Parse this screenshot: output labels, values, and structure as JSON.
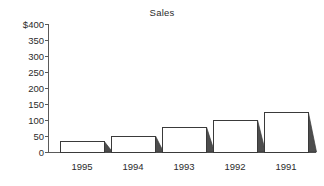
{
  "chart_data": {
    "type": "bar",
    "title": "Sales",
    "xlabel": "",
    "ylabel": "",
    "categories": [
      "1995",
      "1994",
      "1993",
      "1992",
      "1991"
    ],
    "values": [
      32,
      50,
      78,
      100,
      122
    ],
    "ylim": [
      0,
      400
    ],
    "ytick_labels": [
      "$400",
      "350",
      "300",
      "250",
      "200",
      "150",
      "100",
      "50",
      "0"
    ],
    "ytick_values": [
      400,
      350,
      300,
      250,
      200,
      150,
      100,
      50,
      0
    ],
    "grid": false,
    "legend": false,
    "style": {
      "bar_face_color": "#ffffff",
      "bar_edge_color": "#3a3a3a",
      "bar_shadow_color": "#4d4d4d",
      "axis_color": "#5a5a5a",
      "text_color": "#2b2b2b",
      "background": "#ffffff",
      "three_d_shadow": true
    }
  },
  "axis": {
    "y_tick_0": "$400",
    "y_tick_1": "350",
    "y_tick_2": "300",
    "y_tick_3": "250",
    "y_tick_4": "200",
    "y_tick_5": "150",
    "y_tick_6": "100",
    "y_tick_7": "50",
    "y_tick_8": "0",
    "x_tick_0": "1995",
    "x_tick_1": "1994",
    "x_tick_2": "1993",
    "x_tick_3": "1992",
    "x_tick_4": "1991"
  }
}
